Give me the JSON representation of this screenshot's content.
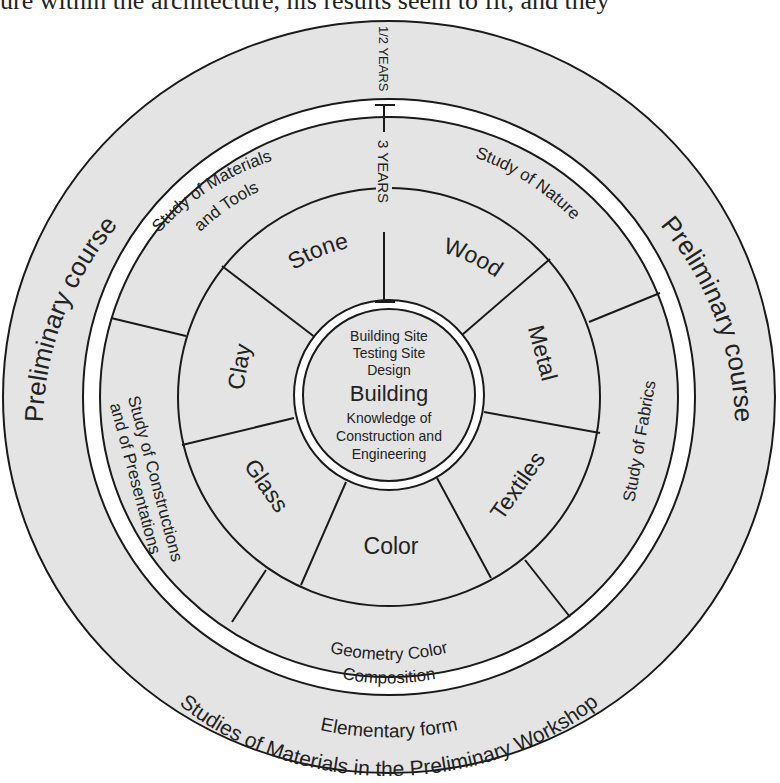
{
  "page": {
    "top_text": "ure within the architecture, his results seem to fit, and they"
  },
  "diagram": {
    "colors": {
      "fill": "#e4e4e4",
      "stroke": "#1a1a1a",
      "band": "#ffffff",
      "text": "#222222"
    },
    "durations": {
      "outer": "1/2 YEARS",
      "inner": "3 YEARS"
    },
    "outer_ring": {
      "left_label": "Preliminary course",
      "right_label": "Preliminary course",
      "bottom_line1": "Elementary form",
      "bottom_line2": "Studies of Materials in the Preliminary Workshop"
    },
    "middle_ring": [
      {
        "id": "materials-tools",
        "line1": "Study of Materials",
        "line2": "and Tools"
      },
      {
        "id": "nature",
        "line1": "Study of Nature",
        "line2": ""
      },
      {
        "id": "fabrics",
        "line1": "Study of Fabrics",
        "line2": ""
      },
      {
        "id": "geometry",
        "line1": "Geometry Color",
        "line2": "Composition"
      },
      {
        "id": "constructions",
        "line1": "Study of Constructions",
        "line2": "and of Presentations"
      }
    ],
    "material_ring": [
      "Stone",
      "Wood",
      "Metal",
      "Textiles",
      "Color",
      "Glass",
      "Clay"
    ],
    "center": {
      "top_lines": [
        "Building Site",
        "Testing Site",
        "Design"
      ],
      "title": "Building",
      "bottom_lines": [
        "Knowledge of",
        "Construction and",
        "Engineering"
      ]
    }
  }
}
